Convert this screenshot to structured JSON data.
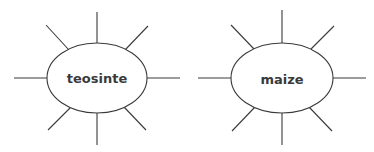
{
  "diagram": {
    "type": "two-spider-diagrams",
    "nodes": [
      {
        "id": "left",
        "label": "teosinte",
        "rays": 8
      },
      {
        "id": "right",
        "label": "maize",
        "rays": 8
      }
    ],
    "colors": {
      "stroke": "#3a3a3a",
      "text": "#3a3a3a",
      "background": "#ffffff"
    }
  }
}
